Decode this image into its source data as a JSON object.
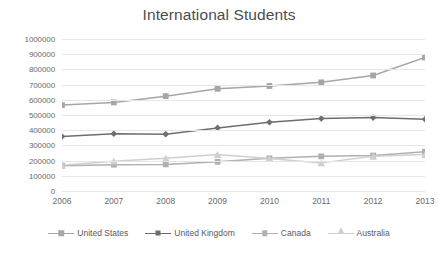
{
  "chart_data": {
    "type": "line",
    "title": "International Students",
    "xlabel": "",
    "ylabel": "",
    "categories": [
      "2006",
      "2007",
      "2008",
      "2009",
      "2010",
      "2011",
      "2012",
      "2013"
    ],
    "ylim": [
      0,
      1000000
    ],
    "y_ticks": [
      "1000000",
      "900000",
      "800000",
      "700000",
      "600000",
      "500000",
      "400000",
      "300000",
      "200000",
      "100000",
      "0"
    ],
    "y_tick_values": [
      1000000,
      900000,
      800000,
      700000,
      600000,
      500000,
      400000,
      300000,
      200000,
      100000,
      0
    ],
    "grid": true,
    "legend_position": "bottom",
    "series": [
      {
        "name": "United States",
        "marker": "square",
        "color": "#a6a6a6",
        "values": [
          565000,
          583000,
          624000,
          672000,
          691000,
          715000,
          760000,
          878000
        ]
      },
      {
        "name": "United Kingdom",
        "marker": "diamond",
        "color": "#6e6e6e",
        "values": [
          359000,
          377000,
          374000,
          415000,
          452000,
          477000,
          483000,
          472000
        ]
      },
      {
        "name": "Canada",
        "marker": "square",
        "color": "#b0b0b0",
        "values": [
          166000,
          173000,
          175000,
          192000,
          215000,
          228000,
          233000,
          259000
        ]
      },
      {
        "name": "Australia",
        "marker": "triangle",
        "color": "#cfcfcf",
        "values": [
          170000,
          196000,
          216000,
          240000,
          214000,
          185000,
          228000,
          240000
        ]
      }
    ]
  },
  "colors": {
    "grid": "#e6e6e6",
    "title": "#4d4d4d",
    "tick_text": "#6b6b6b",
    "background": "#ffffff"
  }
}
